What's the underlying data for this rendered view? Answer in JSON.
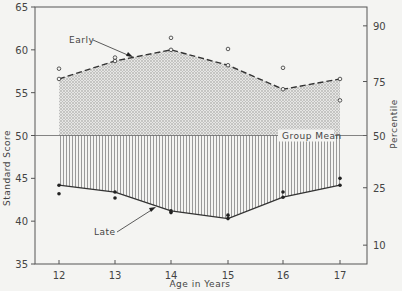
{
  "chart_data": {
    "type": "line",
    "title": "",
    "xlabel": "Age in Years",
    "ylabel": "Standard Score",
    "y2label": "Percentile",
    "x": [
      12,
      13,
      14,
      15,
      16,
      17
    ],
    "xticks": [
      "12",
      "13",
      "14",
      "15",
      "16",
      "17"
    ],
    "ylim": [
      35,
      65
    ],
    "yticks": [
      35,
      40,
      45,
      50,
      55,
      60,
      65
    ],
    "y2ticks": [
      {
        "label": "90",
        "score": 62.8
      },
      {
        "label": "75",
        "score": 56.3
      },
      {
        "label": "50",
        "score": 50
      },
      {
        "label": "25",
        "score": 43.9
      },
      {
        "label": "10",
        "score": 37.2
      }
    ],
    "grid": false,
    "series": [
      {
        "name": "Early",
        "style": "dashed",
        "marker": "open-circle",
        "fill": "stippled (to group mean)",
        "values": [
          56.6,
          58.7,
          60.0,
          58.2,
          55.4,
          56.6
        ]
      },
      {
        "name": "Early (individual points)",
        "style": "none",
        "marker": "open-circle",
        "values": [
          57.8,
          59.1,
          61.4,
          60.1,
          57.9,
          54.1
        ]
      },
      {
        "name": "Late",
        "style": "solid",
        "marker": "filled-circle",
        "fill": "vertical hatch (to group mean)",
        "values": [
          44.2,
          43.4,
          41.2,
          40.3,
          42.8,
          44.2
        ]
      },
      {
        "name": "Late (individual points)",
        "style": "none",
        "marker": "filled-circle",
        "values": [
          43.2,
          42.7,
          41.0,
          40.7,
          43.4,
          45.0
        ]
      }
    ],
    "reference_lines": [
      {
        "label": "Group Mean",
        "value": 50
      }
    ],
    "annotations": [
      {
        "text": "Early",
        "points_to": "Early series near age 13.5"
      },
      {
        "text": "Late",
        "points_to": "Late series near age 13.7"
      },
      {
        "text": "Group Mean",
        "at": 50
      }
    ]
  },
  "labels": {
    "xlabel": "Age in Years",
    "ylabel": "Standard Score",
    "y2label": "Percentile",
    "early": "Early",
    "late": "Late",
    "group_mean": "Group Mean"
  }
}
